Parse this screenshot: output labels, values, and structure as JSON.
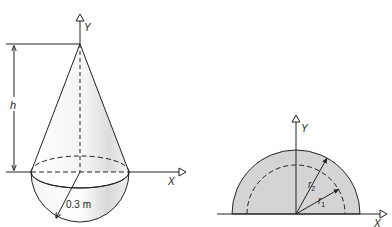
{
  "figure_left": {
    "title": "Cone on hemisphere",
    "y_axis_label": "Y",
    "x_axis_label": "X",
    "height_label": "h",
    "radius_label": "0.3 m"
  },
  "figure_right": {
    "title": "Half annulus cross-section",
    "y_axis_label": "Y",
    "x_axis_label": "X",
    "outer_radius_label": "r",
    "outer_radius_sub": "2",
    "inner_radius_label": "r",
    "inner_radius_sub": "1"
  },
  "colors": {
    "stroke": "#222222",
    "fill_gray": "#d4d4d4",
    "shade_light": "#e6e6e6"
  }
}
